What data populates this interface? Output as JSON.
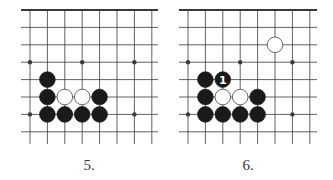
{
  "diagrams": [
    {
      "caption": "5.",
      "origin_x": 30,
      "top_edge_left": 21,
      "top_edge_right": 158,
      "grid": {
        "cols": 8,
        "rows": 8,
        "spacing": 17.4,
        "top": 10,
        "bottom": 144
      },
      "star_points": [
        [
          0,
          3
        ],
        [
          3,
          3
        ],
        [
          6,
          3
        ],
        [
          0,
          6
        ],
        [
          6,
          6
        ]
      ],
      "stones": [
        {
          "col": 1,
          "row": 4,
          "color": "black"
        },
        {
          "col": 1,
          "row": 5,
          "color": "black"
        },
        {
          "col": 2,
          "row": 5,
          "color": "white"
        },
        {
          "col": 3,
          "row": 5,
          "color": "white"
        },
        {
          "col": 4,
          "row": 5,
          "color": "black"
        },
        {
          "col": 1,
          "row": 6,
          "color": "black"
        },
        {
          "col": 2,
          "row": 6,
          "color": "black"
        },
        {
          "col": 3,
          "row": 6,
          "color": "black"
        },
        {
          "col": 4,
          "row": 6,
          "color": "black"
        }
      ]
    },
    {
      "caption": "6.",
      "origin_x": 188,
      "top_edge_left": 179,
      "top_edge_right": 317,
      "grid": {
        "cols": 8,
        "rows": 8,
        "spacing": 17.4,
        "top": 10,
        "bottom": 144
      },
      "star_points": [
        [
          0,
          3
        ],
        [
          3,
          3
        ],
        [
          6,
          3
        ],
        [
          0,
          6
        ],
        [
          6,
          6
        ]
      ],
      "stones": [
        {
          "col": 5,
          "row": 2,
          "color": "white"
        },
        {
          "col": 1,
          "row": 4,
          "color": "black"
        },
        {
          "col": 2,
          "row": 4,
          "color": "black",
          "label": "1"
        },
        {
          "col": 1,
          "row": 5,
          "color": "black"
        },
        {
          "col": 2,
          "row": 5,
          "color": "white"
        },
        {
          "col": 3,
          "row": 5,
          "color": "white"
        },
        {
          "col": 4,
          "row": 5,
          "color": "black"
        },
        {
          "col": 1,
          "row": 6,
          "color": "black"
        },
        {
          "col": 2,
          "row": 6,
          "color": "black"
        },
        {
          "col": 3,
          "row": 6,
          "color": "black"
        },
        {
          "col": 4,
          "row": 6,
          "color": "black"
        }
      ]
    }
  ],
  "colors": {
    "line": "#3a3a3a",
    "black_stone": "#1a1a1a",
    "white_stone": "#ffffff",
    "caption": "#333333"
  }
}
